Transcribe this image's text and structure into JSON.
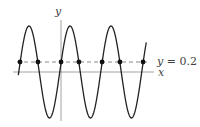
{
  "figure": {
    "type": "function-graph",
    "axes": {
      "x_label": "x",
      "y_label": "y"
    },
    "curve": {
      "description": "sinusoidal curve oscillating about the x-axis",
      "color": "#222222",
      "periods_shown": 3
    },
    "horizontal_line": {
      "label_var": "y",
      "label_eq": " = 0.2",
      "value": 0.2,
      "style": "dashed",
      "color": "#666666"
    },
    "intersection_points": {
      "count": 7,
      "color": "#111111"
    }
  },
  "colors": {
    "axis": "#777777",
    "curve": "#222222",
    "dash": "#666666",
    "dot": "#111111"
  }
}
